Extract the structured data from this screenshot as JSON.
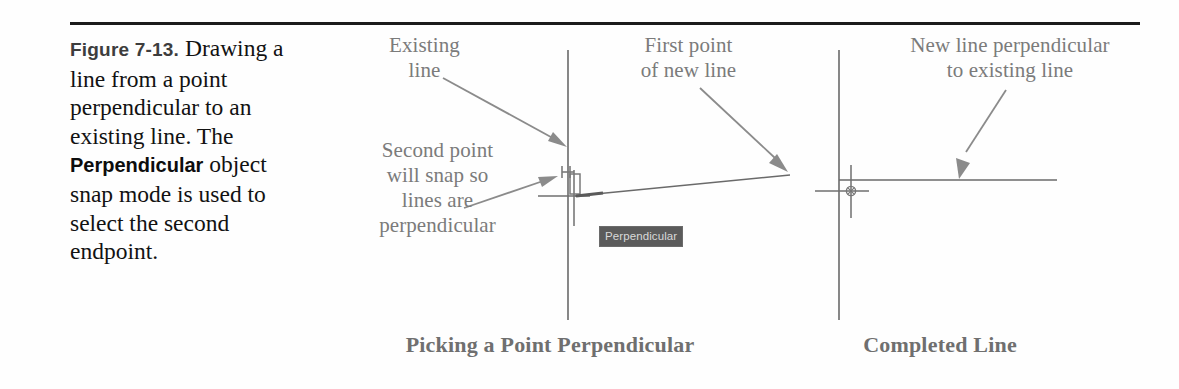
{
  "figure": {
    "number": "Figure 7-13.",
    "caption_part1": "Drawing a line from a point perpendicular to an existing line. The ",
    "caption_bold": "Perpendicular",
    "caption_part2": " object snap mode is used to select the second endpoint."
  },
  "annotations": {
    "existing_line": "Existing\nline",
    "second_point": "Second point\nwill snap so\nlines are\nperpendicular",
    "first_point": "First point\nof new line",
    "new_line_perpendicular": "New line perpendicular\nto existing line"
  },
  "tooltip": {
    "label": "Perpendicular"
  },
  "subcaptions": {
    "left": "Picking a Point Perpendicular",
    "right": "Completed Line"
  },
  "colors": {
    "rule": "#1b1b1b",
    "caption_text": "#121212",
    "annotation_text": "#7b7b7b",
    "drawing_line": "#5f5f5f",
    "tooltip_bg": "#5b5b5b",
    "tooltip_text": "#d9d9d9",
    "subcaption_text": "#6f6f6f"
  },
  "diagrams": {
    "left_panel_title": "Picking a Point Perpendicular",
    "right_panel_title": "Completed Line"
  }
}
